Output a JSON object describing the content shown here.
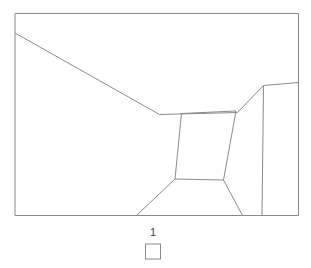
{
  "figure": {
    "canvas": {
      "width": 311,
      "height": 268,
      "background_color": "#ffffff"
    },
    "line_color": "#8a8a8a",
    "line_width": 1,
    "frame": {
      "name": "picture-frame",
      "x": 15,
      "y": 13.5,
      "width": 283.5,
      "height": 202
    },
    "elements": [
      {
        "name": "ceiling-left-diagonal",
        "kind": "polyline",
        "points": "15,33 159.5,114.5"
      },
      {
        "name": "back-wall-top-edge",
        "kind": "polyline",
        "points": "159.5,114.5 237.5,112.5"
      },
      {
        "name": "right-alcove-rising-diagonal",
        "kind": "polyline",
        "points": "237.5,112.5 263.5,85.5"
      },
      {
        "name": "right-alcove-top-edge",
        "kind": "polyline",
        "points": "263.5,85.5 298.5,82.5"
      },
      {
        "name": "right-alcove-vertical-edge",
        "kind": "polyline",
        "points": "263.5,85.5 262,215.5"
      },
      {
        "name": "center-recess-quadrilateral",
        "kind": "polygon",
        "points": "181.5,113.5 236,111 223.5,180 175,179"
      },
      {
        "name": "floor-left-diagonal",
        "kind": "polyline",
        "points": "175,179 136.5,215.5"
      },
      {
        "name": "floor-right-diagonal",
        "kind": "polyline",
        "points": "223.5,180 242.5,215.5"
      }
    ],
    "caption": {
      "label": "1",
      "swatch": {
        "name": "swatch-square",
        "x": 145,
        "y": 243.5,
        "width": 16,
        "height": 16,
        "fill_color": "#ffffff",
        "stroke_color": "#8a8a8a"
      }
    }
  }
}
